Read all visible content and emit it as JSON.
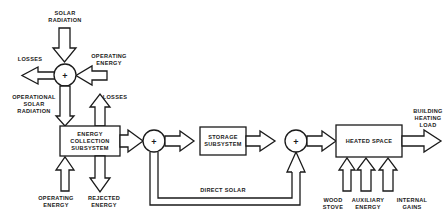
{
  "diagram": {
    "type": "block-flow",
    "nodes": {
      "top_junction": {
        "symbol": "+"
      },
      "energy_collection": {
        "label_lines": [
          "ENERGY",
          "COLLECTION",
          "SUBSYSTEM"
        ]
      },
      "junction_after_collection": {
        "symbol": "+"
      },
      "storage": {
        "label_lines": [
          "STORAGE",
          "SUBSYSTEM"
        ]
      },
      "junction_after_storage": {
        "symbol": "+"
      },
      "heated_space": {
        "label_lines": [
          "HEATED SPACE"
        ]
      }
    },
    "labels": {
      "solar_radiation": [
        "SOLAR",
        "RADIATION"
      ],
      "losses_top": [
        "LOSSES"
      ],
      "operating_energy_top": [
        "OPERATING",
        "ENERGY"
      ],
      "operational_solar_radiation": [
        "OPERATIONAL",
        "SOLAR",
        "RADIATION"
      ],
      "losses_collection": [
        "LOSSES"
      ],
      "operating_energy_bottom": [
        "OPERATING",
        "ENERGY"
      ],
      "rejected_energy": [
        "REJECTED",
        "ENERGY"
      ],
      "direct_solar": [
        "DIRECT SOLAR"
      ],
      "building_heating_load": [
        "BUILDING",
        "HEATING",
        "LOAD"
      ],
      "wood_stove": [
        "WOOD",
        "STOVE"
      ],
      "auxiliary_energy": [
        "AUXILIARY",
        "ENERGY"
      ],
      "internal_gains": [
        "INTERNAL",
        "GAINS"
      ]
    },
    "edges": [
      {
        "from": "solar_radiation",
        "to": "top_junction"
      },
      {
        "from": "operating_energy_top",
        "to": "top_junction"
      },
      {
        "from": "top_junction",
        "to": "losses_top"
      },
      {
        "from": "top_junction",
        "to": "energy_collection",
        "label": "operational_solar_radiation"
      },
      {
        "from": "energy_collection",
        "to": "losses_collection"
      },
      {
        "from": "operating_energy_bottom",
        "to": "energy_collection"
      },
      {
        "from": "energy_collection",
        "to": "rejected_energy"
      },
      {
        "from": "energy_collection",
        "to": "junction_after_collection"
      },
      {
        "from": "junction_after_collection",
        "to": "storage"
      },
      {
        "from": "storage",
        "to": "junction_after_storage"
      },
      {
        "from": "junction_after_collection",
        "to": "junction_after_storage",
        "label": "direct_solar"
      },
      {
        "from": "junction_after_storage",
        "to": "heated_space"
      },
      {
        "from": "wood_stove",
        "to": "heated_space"
      },
      {
        "from": "auxiliary_energy",
        "to": "heated_space"
      },
      {
        "from": "internal_gains",
        "to": "heated_space"
      },
      {
        "from": "heated_space",
        "to": "building_heating_load"
      }
    ]
  }
}
